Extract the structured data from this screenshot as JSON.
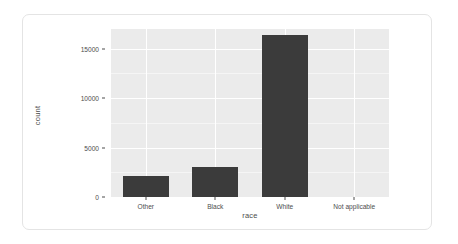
{
  "chart_data": {
    "type": "bar",
    "title": "",
    "subtitle": "",
    "xlabel": "race",
    "ylabel": "count",
    "categories": [
      "Other",
      "Black",
      "White",
      "Not applicable"
    ],
    "values": [
      2100,
      3000,
      16400,
      0
    ],
    "ylim": [
      0,
      17000
    ],
    "y_ticks": [
      0,
      5000,
      10000,
      15000
    ],
    "y_tick_labels": [
      "0",
      "5000",
      "10000",
      "15000"
    ],
    "grid": true,
    "legend": "none",
    "bar_color": "#3b3b3b",
    "panel_background": "#ebebeb",
    "gridline_color": "#ffffff",
    "axis_text_color": "#4d4d4d",
    "series": [
      {
        "name": "count",
        "values": [
          2100,
          3000,
          16400,
          0
        ]
      }
    ]
  },
  "card": {
    "background": "#ffffff",
    "border_color": "#e4e4e4"
  }
}
